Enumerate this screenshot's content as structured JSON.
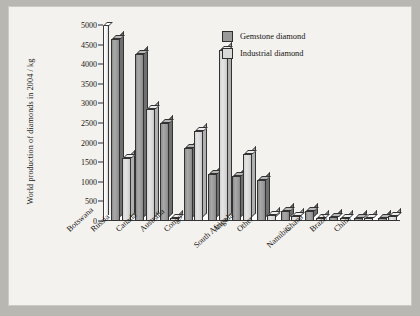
{
  "chart_data": {
    "type": "bar",
    "title": "",
    "xlabel": "",
    "ylabel": "World production of diamonds in 2004 / kg",
    "ylim": [
      0,
      5000
    ],
    "yticks": [
      0,
      500,
      1000,
      1500,
      2000,
      2500,
      3000,
      3500,
      4000,
      4500,
      5000
    ],
    "grid": false,
    "legend_position": "top-right",
    "categories": [
      "Botswana",
      "Russia",
      "Canada",
      "Australia",
      "Congo",
      "South Africa",
      "Angola",
      "Other",
      "Namibia",
      "Ghana",
      "Brazil",
      "China"
    ],
    "series": [
      {
        "name": "Gemstone diamond",
        "color": "#9a9a9a",
        "values": [
          4650,
          4250,
          2500,
          1850,
          1200,
          1150,
          1050,
          250,
          250,
          100,
          50,
          50
        ]
      },
      {
        "name": "Industrial diamond",
        "color": "#d9d9d9",
        "values": [
          1600,
          2850,
          20,
          2300,
          4350,
          1700,
          150,
          130,
          20,
          50,
          20,
          120
        ]
      }
    ]
  },
  "legend": {
    "items": [
      {
        "label": "Gemstone diamond",
        "swatch": "gem"
      },
      {
        "label": "Industrial diamond",
        "swatch": "ind"
      }
    ]
  }
}
